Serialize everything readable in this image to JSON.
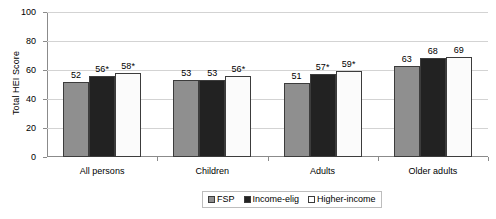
{
  "chart_data": {
    "type": "bar",
    "title": "",
    "xlabel": "",
    "ylabel": "Total HEI Score",
    "ylim": [
      0,
      100
    ],
    "yticks": [
      0,
      20,
      40,
      60,
      80,
      100
    ],
    "grid": true,
    "legend_position": "bottom-center",
    "categories": [
      "All persons",
      "Children",
      "Adults",
      "Older adults"
    ],
    "series": [
      {
        "name": "FSP",
        "color": "#8f8f8f",
        "values": [
          52,
          53,
          51,
          63
        ],
        "labels": [
          "52",
          "53",
          "51",
          "63"
        ]
      },
      {
        "name": "Income-elig",
        "color": "#222222",
        "values": [
          56,
          53,
          57,
          68
        ],
        "labels": [
          "56*",
          "53",
          "57*",
          "68"
        ]
      },
      {
        "name": "Higher-income",
        "color": "#ffffff",
        "values": [
          58,
          56,
          59,
          69
        ],
        "labels": [
          "58*",
          "56*",
          "59*",
          "69"
        ]
      }
    ]
  },
  "axis": {
    "y_title": "Total HEI Score",
    "y_tick_labels": [
      "100",
      "80",
      "60",
      "40",
      "20",
      "0"
    ]
  },
  "legend": {
    "items": [
      {
        "label": "FSP",
        "swatch": "fsp"
      },
      {
        "label": "Income-elig",
        "swatch": "elig"
      },
      {
        "label": "Higher-income",
        "swatch": "higher"
      }
    ]
  }
}
